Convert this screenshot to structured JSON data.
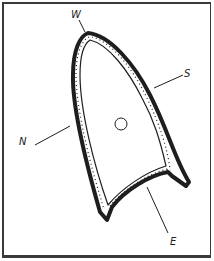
{
  "figure": {
    "labels": {
      "west": "W",
      "south": "S",
      "north": "N",
      "east": "E"
    },
    "colors": {
      "ink": "#1e1e1e",
      "paper": "#ffffff",
      "frame": "#3a3a3a"
    }
  }
}
